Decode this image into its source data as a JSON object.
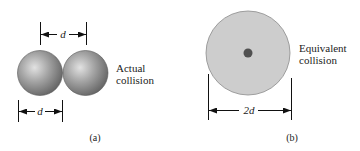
{
  "figure": {
    "panels": [
      {
        "id": "a",
        "caption": "(a)",
        "label_line1": "Actual",
        "label_line2": "collision",
        "top_dimension": "d",
        "bottom_dimension": "d"
      },
      {
        "id": "b",
        "caption": "(b)",
        "label_line1": "Equivalent",
        "label_line2": "collision",
        "dimension": "2d"
      }
    ],
    "colors": {
      "sphere_dark": "#6e6e6e",
      "sphere_light": "#d8d8d8",
      "disk_fill": "#cfcfcf",
      "disk_stroke": "#8a8a8a",
      "center_dot": "#555555",
      "line": "#111111",
      "text": "#222222"
    }
  }
}
